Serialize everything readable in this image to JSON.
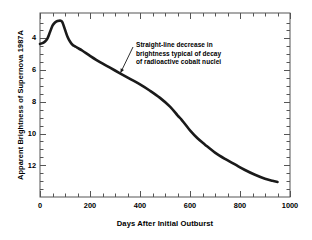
{
  "figure": {
    "background_color": "#ffffff",
    "line_color": "#1a1a1a",
    "frame_color": "#555555"
  },
  "chart_data": {
    "type": "line",
    "title": "",
    "subtitle": "",
    "xlabel": "Days After Initial Outburst",
    "ylabel": "Apparent Brightness of Supernova 1987A",
    "xlim": [
      0,
      1000
    ],
    "ylim": [
      14.0,
      2.4
    ],
    "y_axis_inverted": true,
    "y_axis_note": "apparent magnitude: smaller number = brighter",
    "grid": false,
    "legend_position": "none",
    "xticks": [
      0,
      200,
      400,
      600,
      800,
      1000
    ],
    "xtick_labels": [
      "0",
      "200",
      "400",
      "600",
      "800",
      "1000"
    ],
    "x_minor_tick_interval": 50,
    "yticks": [
      4,
      6,
      8,
      10,
      12
    ],
    "ytick_labels": [
      "4",
      "6",
      "8",
      "10",
      "12"
    ],
    "y_minor_tick_interval": 0.5,
    "series": [
      {
        "name": "Apparent brightness of SN 1987A",
        "x": [
          0,
          10,
          20,
          30,
          40,
          50,
          60,
          70,
          80,
          85,
          90,
          100,
          110,
          120,
          130,
          140,
          150,
          170,
          200,
          240,
          280,
          320,
          360,
          400,
          440,
          480,
          520,
          550,
          565,
          580,
          600,
          630,
          660,
          700,
          740,
          780,
          820,
          860,
          900,
          930,
          950
        ],
        "y": [
          4.35,
          4.3,
          4.2,
          4.0,
          3.6,
          3.2,
          3.0,
          2.9,
          2.88,
          2.9,
          3.0,
          3.45,
          3.9,
          4.2,
          4.4,
          4.5,
          4.6,
          4.78,
          5.1,
          5.5,
          5.85,
          6.2,
          6.55,
          6.9,
          7.3,
          7.75,
          8.3,
          8.85,
          9.1,
          9.4,
          9.8,
          10.3,
          10.7,
          11.2,
          11.6,
          11.95,
          12.3,
          12.6,
          12.85,
          12.98,
          13.05
        ]
      }
    ],
    "annotations": [
      {
        "name": "cobalt-decay-annotation",
        "lines": [
          "Straight-line decrease in",
          "brightness typical of decay",
          "of radioactive cobalt nuclei"
        ],
        "arrow_points_to_x": 330,
        "arrow_points_to_y": 6.3
      }
    ]
  }
}
